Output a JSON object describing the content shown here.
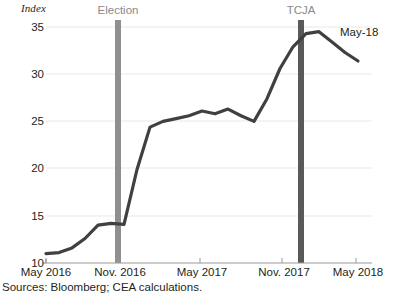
{
  "chart_data": {
    "type": "line",
    "title": "",
    "subtitle": "",
    "xlabel": "",
    "ylabel": "Index",
    "ylim": [
      10,
      35
    ],
    "xlim": [
      "May 2016",
      "May 2018"
    ],
    "grid": true,
    "legend_position": "none",
    "y_ticks": [
      "35",
      "30",
      "25",
      "20",
      "15",
      "10"
    ],
    "y_tick_values": [
      35,
      30,
      25,
      20,
      15,
      10
    ],
    "x_ticks": [
      "May 2016",
      "Nov. 2016",
      "May 2017",
      "Nov. 2017",
      "May 2018"
    ],
    "x_tick_values": [
      "2016-05",
      "2016-11",
      "2017-05",
      "2017-11",
      "2018-05"
    ],
    "series": [
      {
        "name": "Index",
        "color": "#404040",
        "x": [
          "2016-05",
          "2016-06",
          "2016-07",
          "2016-08",
          "2016-09",
          "2016-10",
          "2016-11",
          "2016-12",
          "2017-01",
          "2017-02",
          "2017-03",
          "2017-04",
          "2017-05",
          "2017-06",
          "2017-07",
          "2017-08",
          "2017-09",
          "2017-10",
          "2017-11",
          "2017-12",
          "2018-01",
          "2018-02",
          "2018-03",
          "2018-04",
          "2018-05"
        ],
        "values": [
          11.0,
          11.1,
          11.6,
          12.6,
          14.0,
          14.2,
          14.1,
          19.9,
          24.4,
          25.0,
          25.3,
          25.6,
          26.1,
          25.8,
          26.3,
          25.6,
          25.0,
          27.4,
          30.6,
          32.9,
          34.3,
          34.5,
          33.4,
          32.3,
          31.4
        ]
      }
    ],
    "annotations": [
      {
        "name": "election-marker",
        "label": "Election",
        "x": "2016-11",
        "type": "vertical-band",
        "color": "#8a8a8a"
      },
      {
        "name": "tcja-marker",
        "label": "TCJA",
        "x": "2017-12",
        "type": "vertical-band",
        "color": "#595959"
      },
      {
        "name": "endpoint-label",
        "label": "May-18",
        "x": "2018-05",
        "type": "point-label"
      }
    ],
    "source_note": "Sources: Bloomberg; CEA calculations."
  },
  "colors": {
    "line": "#404040",
    "grid": "#e8e8e8",
    "axis": "#9a9a9a",
    "text": "#231f20",
    "marker_light": "#8a8a8a",
    "marker_dark": "#595959"
  }
}
